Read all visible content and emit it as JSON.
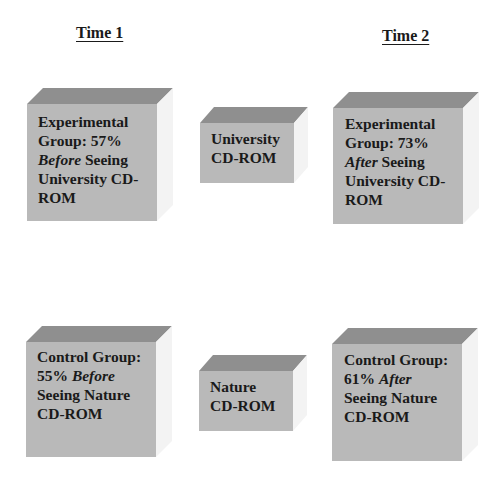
{
  "headings": {
    "time1": "Time 1",
    "time2": "Time 2"
  },
  "boxes": {
    "exp_before": {
      "lines": [
        {
          "pre": "Experimental",
          "em": "",
          "post": ""
        },
        {
          "pre": "Group: 57%",
          "em": "",
          "post": ""
        },
        {
          "pre": "",
          "em": "Before",
          "post": " Seeing"
        },
        {
          "pre": "University CD-",
          "em": "",
          "post": ""
        },
        {
          "pre": "ROM",
          "em": "",
          "post": ""
        }
      ]
    },
    "university": {
      "lines": [
        {
          "pre": "University",
          "em": "",
          "post": ""
        },
        {
          "pre": "CD-ROM",
          "em": "",
          "post": ""
        }
      ]
    },
    "exp_after": {
      "lines": [
        {
          "pre": "Experimental",
          "em": "",
          "post": ""
        },
        {
          "pre": "Group: 73%",
          "em": "",
          "post": ""
        },
        {
          "pre": "",
          "em": "After",
          "post": " Seeing"
        },
        {
          "pre": "University CD-",
          "em": "",
          "post": ""
        },
        {
          "pre": "ROM",
          "em": "",
          "post": ""
        }
      ]
    },
    "ctrl_before": {
      "lines": [
        {
          "pre": "Control Group:",
          "em": "",
          "post": ""
        },
        {
          "pre": "55% ",
          "em": "Before",
          "post": ""
        },
        {
          "pre": "Seeing Nature",
          "em": "",
          "post": ""
        },
        {
          "pre": "CD-ROM",
          "em": "",
          "post": ""
        }
      ]
    },
    "nature": {
      "lines": [
        {
          "pre": "Nature",
          "em": "",
          "post": ""
        },
        {
          "pre": "CD-ROM",
          "em": "",
          "post": ""
        }
      ]
    },
    "ctrl_after": {
      "lines": [
        {
          "pre": "Control Group:",
          "em": "",
          "post": ""
        },
        {
          "pre": "61% ",
          "em": "After",
          "post": ""
        },
        {
          "pre": "Seeing Nature",
          "em": "",
          "post": ""
        },
        {
          "pre": "CD-ROM",
          "em": "",
          "post": ""
        }
      ]
    }
  },
  "colors": {
    "front": "#b9b9b9",
    "top": "#8f8f8f",
    "side": "#f3f3f3",
    "text": "#1a1a1a"
  }
}
